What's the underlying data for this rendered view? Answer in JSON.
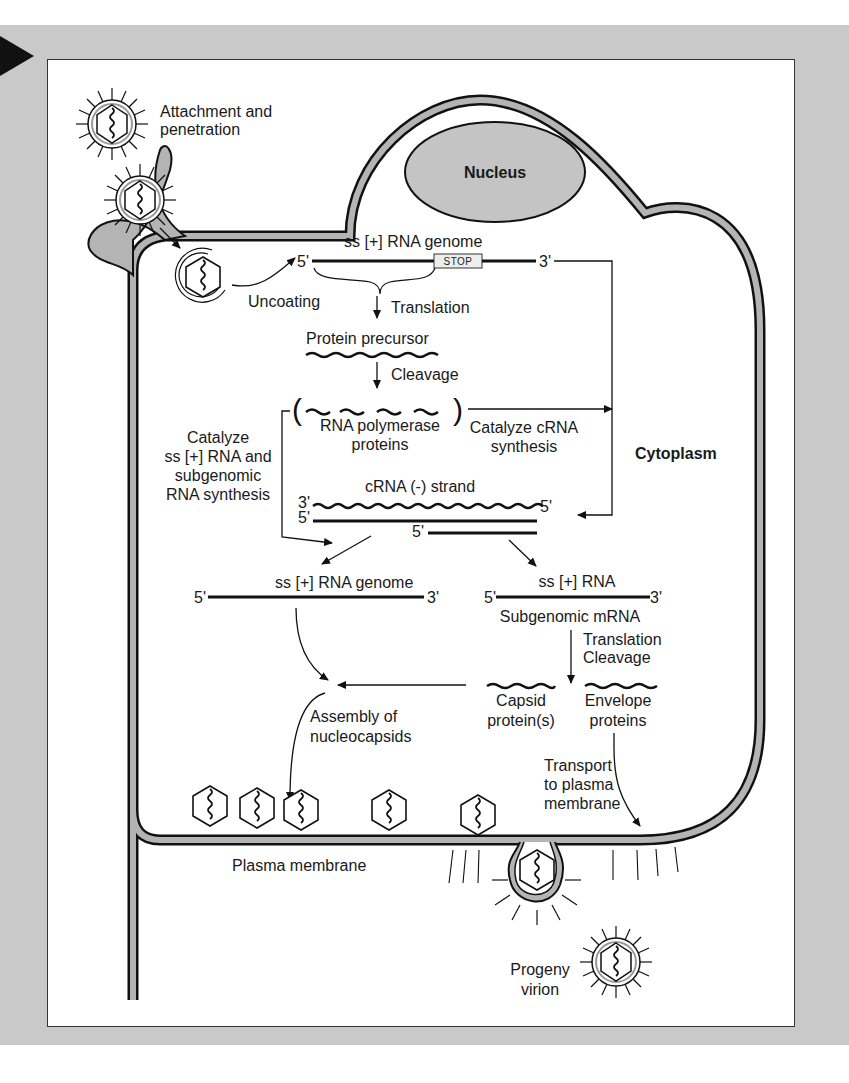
{
  "figure": {
    "background_frame_color": "#c9c9c9",
    "membrane_color": "#b4b4b4",
    "nucleus_color": "#c4c4c4"
  },
  "compartments": {
    "nucleus": "Nucleus",
    "cytoplasm": "Cytoplasm",
    "plasma_membrane": "Plasma membrane"
  },
  "steps": {
    "attachment": "Attachment and",
    "attachment_2": "penetration",
    "uncoating": "Uncoating",
    "translation": "Translation",
    "cleavage": "Cleavage",
    "catalyze_crna_1": "Catalyze cRNA",
    "catalyze_crna_2": "synthesis",
    "catalyze_ss_1": "Catalyze",
    "catalyze_ss_2": "ss [+] RNA and",
    "catalyze_ss_3": "subgenomic",
    "catalyze_ss_4": "RNA synthesis",
    "translation_cleavage_1": "Translation",
    "translation_cleavage_2": "Cleavage",
    "assembly_1": "Assembly of",
    "assembly_2": "nucleocapsids",
    "transport_1": "Transport",
    "transport_2": "to plasma",
    "transport_3": "membrane",
    "progeny_1": "Progeny",
    "progeny_2": "virion"
  },
  "molecules": {
    "genome_top": "ss [+] RNA genome",
    "stop_codon": "STOP",
    "five_prime": "5'",
    "three_prime": "3'",
    "protein_precursor": "Protein precursor",
    "rna_polymerase_1": "RNA polymerase",
    "rna_polymerase_2": "proteins",
    "crna_strand": "cRNA (-) strand",
    "genome_bottom": "ss [+] RNA genome",
    "ss_rna": "ss [+] RNA",
    "subgenomic_mrna": "Subgenomic mRNA",
    "capsid_1": "Capsid",
    "capsid_2": "protein(s)",
    "envelope_1": "Envelope",
    "envelope_2": "proteins"
  }
}
